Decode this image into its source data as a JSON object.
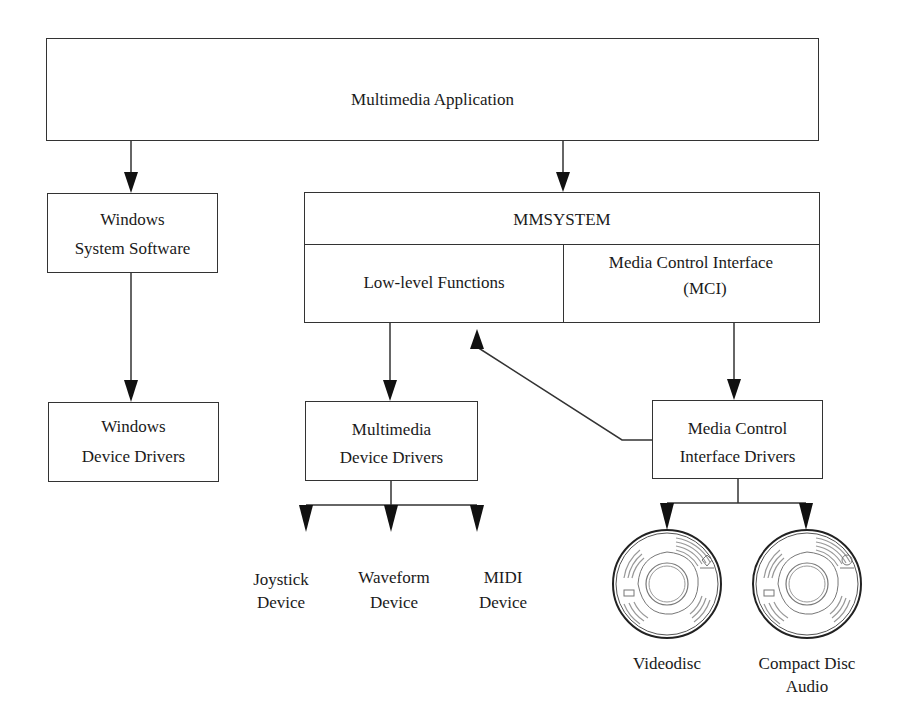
{
  "diagram": {
    "app": {
      "label": "Multimedia Application"
    },
    "windows_system_software": {
      "line1": "Windows",
      "line2": "System Software"
    },
    "windows_device_drivers": {
      "line1": "Windows",
      "line2": "Device Drivers"
    },
    "mmsystem": {
      "title": "MMSYSTEM",
      "low_level": "Low-level Functions",
      "mci_line1": "Media Control Interface",
      "mci_line2": "(MCI)"
    },
    "multimedia_device_drivers": {
      "line1": "Multimedia",
      "line2": "Device Drivers"
    },
    "mci_drivers": {
      "line1": "Media Control",
      "line2": "Interface Drivers"
    },
    "devices": [
      {
        "line1": "Joystick",
        "line2": "Device"
      },
      {
        "line1": "Waveform",
        "line2": "Device"
      },
      {
        "line1": "MIDI",
        "line2": "Device"
      }
    ],
    "media": [
      {
        "line1": "Videodisc",
        "line2": ""
      },
      {
        "line1": "Compact Disc",
        "line2": "Audio"
      }
    ]
  }
}
